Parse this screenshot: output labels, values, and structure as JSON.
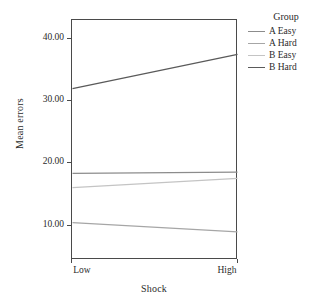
{
  "chart_data": {
    "type": "line",
    "title": "",
    "xlabel": "Shock",
    "ylabel": "Mean errors",
    "categories": [
      "Low",
      "High"
    ],
    "x": [
      0,
      1
    ],
    "ylim": [
      4.5,
      43.0
    ],
    "yticks": [
      10.0,
      20.0,
      30.0,
      40.0
    ],
    "ytick_labels": [
      "10.00",
      "20.00",
      "30.00",
      "40.00"
    ],
    "xtick_labels": [
      "Low",
      "High"
    ],
    "grid": false,
    "legend": {
      "title": "Group",
      "position": "right",
      "entries": [
        "A Easy",
        "A Hard",
        "B Easy",
        "B Hard"
      ]
    },
    "series": [
      {
        "name": "A Easy",
        "values": [
          18.4,
          18.6
        ],
        "color": "#8c8c8c"
      },
      {
        "name": "A Hard",
        "values": [
          10.5,
          9.0
        ],
        "color": "#a6a6a6"
      },
      {
        "name": "B Easy",
        "values": [
          16.1,
          17.6
        ],
        "color": "#c4c4c4"
      },
      {
        "name": "B Hard",
        "values": [
          32.0,
          37.5
        ],
        "color": "#5a5a5a"
      }
    ]
  },
  "axes": {
    "y_title": "Mean errors",
    "x_title": "Shock",
    "y_tick_labels": [
      "40.00",
      "30.00",
      "20.00",
      "10.00"
    ],
    "x_tick_labels": [
      "Low",
      "High"
    ]
  },
  "legend": {
    "title": "Group",
    "items": [
      {
        "label": "A Easy",
        "color": "#8c8c8c"
      },
      {
        "label": "A Hard",
        "color": "#a6a6a6"
      },
      {
        "label": "B Easy",
        "color": "#c4c4c4"
      },
      {
        "label": "B Hard",
        "color": "#5a5a5a"
      }
    ]
  }
}
